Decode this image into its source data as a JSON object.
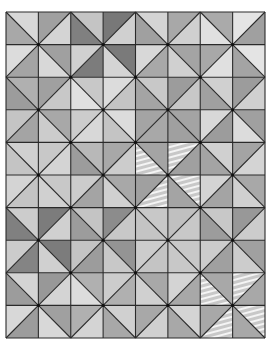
{
  "image": {
    "description": "Half-square triangle quilt in grayscale, 8 columns x 10 rows forming hourglass / pinwheel diamond lattice",
    "grid": {
      "cols": 8,
      "rows": 10,
      "x0": 6,
      "y0": 12,
      "x1": 265,
      "y1": 338
    },
    "line_color": "#2a2a2a",
    "line_width": 1.1,
    "node_color": "#111111",
    "diagonal_rule": "cell (r,c) with (r+c) even uses '\\\\' diagonal, odd uses '/' diagonal; first tone = upper triangle, second tone = lower triangle",
    "fabric_textures": [
      "solid-light",
      "solid-medium",
      "solid-dark",
      "floral",
      "stripes"
    ],
    "rows": [
      [
        [
          "#d8d8d8",
          "#a8a8a8"
        ],
        [
          "#a0a0a0",
          "#d4d4d4"
        ],
        [
          "#c4c4c4",
          "#808080"
        ],
        [
          "#787878",
          "#d0d0d0"
        ],
        [
          "#d4d4d4",
          "#a0a0a0"
        ],
        [
          "#a8a8a8",
          "#d0d0d0"
        ],
        [
          "#aaaaaa",
          "#e0e0e0"
        ],
        [
          "#e4e4e4",
          "#a0a0a0"
        ]
      ],
      [
        [
          "#dcdcdc",
          "#a4a4a4"
        ],
        [
          "#a0a0a0",
          "#d8d8d8"
        ],
        [
          "#d0d0d0",
          "#7c7c7c"
        ],
        [
          "#7a7a7a",
          "#d4d4d4"
        ],
        [
          "#d8d8d8",
          "#a8a8a8"
        ],
        [
          "#a4a4a4",
          "#d0d0d0"
        ],
        [
          "#a8a8a8",
          "#e0e0e0"
        ],
        [
          "#e4e4e4",
          "#a4a4a4"
        ]
      ],
      [
        [
          "#b0b0b0",
          "#9c9c9c"
        ],
        [
          "#a0a0a0",
          "#c8c8c8"
        ],
        [
          "#c8c8c8",
          "#e0e0e0"
        ],
        [
          "#dcdcdc",
          "#c4c4c4"
        ],
        [
          "#c8c8c8",
          "#a4a4a4"
        ],
        [
          "#9c9c9c",
          "#c8c8c8"
        ],
        [
          "#d0d0d0",
          "#a0a0a0"
        ],
        [
          "#9c9c9c",
          "#d0d0d0"
        ]
      ],
      [
        [
          "#c4c4c4",
          "#a4a4a4"
        ],
        [
          "#a8a8a8",
          "#cccccc"
        ],
        [
          "#cccccc",
          "#d8d8d8"
        ],
        [
          "#dcdcdc",
          "#c4c4c4"
        ],
        [
          "#a4a4a4",
          "#a8a8a8"
        ],
        [
          "#a4a4a4",
          "#a0a0a0"
        ],
        [
          "#d8d8d8",
          "#9c9c9c"
        ],
        [
          "#a0a0a0",
          "#dcdcdc"
        ]
      ],
      [
        [
          "#d0d0d0",
          "#c4c4c4"
        ],
        [
          "#c8c8c8",
          "#d4d4d4"
        ],
        [
          "#b8b8b8",
          "#9c9c9c"
        ],
        [
          "#a8a8a8",
          "#cccccc"
        ],
        [
          "#a4a4a4",
          "#d8d8d8"
        ],
        [
          "#c4c4c4",
          "#a0a0a0"
        ],
        [
          "#d0d0d0",
          "#a4a4a4"
        ],
        [
          "#a4a4a4",
          "#d4d4d4"
        ]
      ],
      [
        [
          "#d4d4d4",
          "#c4c4c4"
        ],
        [
          "#c8c8c8",
          "#d0d0d0"
        ],
        [
          "#cccccc",
          "#a4a4a4"
        ],
        [
          "#a8a8a8",
          "#d0d0d0"
        ],
        [
          "#a0a0a0",
          "#c0c0c0"
        ],
        [
          "#d8d8d8",
          "#a4a4a4"
        ],
        [
          "#d4d4d4",
          "#a4a4a4"
        ],
        [
          "#a8a8a8",
          "#d0d0d0"
        ]
      ],
      [
        [
          "#cccccc",
          "#808080"
        ],
        [
          "#7c7c7c",
          "#d0d0d0"
        ],
        [
          "#c4c4c4",
          "#9c9c9c"
        ],
        [
          "#8c8c8c",
          "#c8c8c8"
        ],
        [
          "#c8c8c8",
          "#c4c4c4"
        ],
        [
          "#c0c0c0",
          "#c8c8c8"
        ],
        [
          "#c8c8c8",
          "#9c9c9c"
        ],
        [
          "#989898",
          "#cccccc"
        ]
      ],
      [
        [
          "#cccccc",
          "#848484"
        ],
        [
          "#7c7c7c",
          "#d0d0d0"
        ],
        [
          "#c4c4c4",
          "#9c9c9c"
        ],
        [
          "#949494",
          "#c8c8c8"
        ],
        [
          "#cccccc",
          "#c4c4c4"
        ],
        [
          "#c8c8c8",
          "#c8c8c8"
        ],
        [
          "#cccccc",
          "#a0a0a0"
        ],
        [
          "#a0a0a0",
          "#cccccc"
        ]
      ],
      [
        [
          "#d4d4d4",
          "#9c9c9c"
        ],
        [
          "#989898",
          "#d4d4d4"
        ],
        [
          "#b0b0b0",
          "#dcdcdc"
        ],
        [
          "#cccccc",
          "#b0b0b0"
        ],
        [
          "#a8a8a8",
          "#d0d0d0"
        ],
        [
          "#d4d4d4",
          "#a8a8a8"
        ],
        [
          "#a8a8a8",
          "#d8d8d8"
        ],
        [
          "#c8c8c8",
          "#a8a8a8"
        ]
      ],
      [
        [
          "#d8d8d8",
          "#9c9c9c"
        ],
        [
          "#a0a0a0",
          "#d8d8d8"
        ],
        [
          "#b0b0b0",
          "#d4d4d4"
        ],
        [
          "#d0d0d0",
          "#a8a8a8"
        ],
        [
          "#a8a8a8",
          "#d0d0d0"
        ],
        [
          "#d4d4d4",
          "#a8a8a8"
        ],
        [
          "#a8a8a8",
          "#c8c8c8"
        ],
        [
          "#d8d8d8",
          "#a8a8a8"
        ]
      ]
    ],
    "stripe_cells": [
      [
        4,
        4,
        "bl"
      ],
      [
        4,
        5,
        "tl"
      ],
      [
        5,
        4,
        "br"
      ],
      [
        5,
        5,
        "tr"
      ],
      [
        8,
        6,
        "bl"
      ],
      [
        8,
        7,
        "tl"
      ],
      [
        9,
        6,
        "br"
      ],
      [
        9,
        7,
        "tr"
      ]
    ]
  }
}
